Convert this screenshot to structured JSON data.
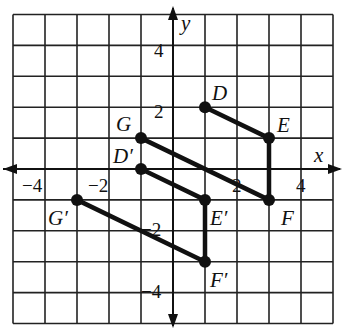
{
  "diagram": {
    "type": "coordinate-plane-translation",
    "grid": {
      "xmin": -5,
      "xmax": 5,
      "ymin": -5,
      "ymax": 5,
      "step": 1
    },
    "axes": {
      "x_label": "x",
      "y_label": "y"
    },
    "ticks": {
      "x": [
        {
          "value": -4,
          "text": "−4"
        },
        {
          "value": -2,
          "text": "−2"
        },
        {
          "value": 2,
          "text": "2"
        },
        {
          "value": 4,
          "text": "4"
        }
      ],
      "y": [
        {
          "value": 4,
          "text": "4"
        },
        {
          "value": 2,
          "text": "2"
        },
        {
          "value": -2,
          "text": "−2"
        },
        {
          "value": -4,
          "text": "−4"
        }
      ]
    },
    "original": {
      "name": "DEFG",
      "vertices": [
        {
          "label": "D",
          "x": 1,
          "y": 2
        },
        {
          "label": "E",
          "x": 3,
          "y": 1
        },
        {
          "label": "F",
          "x": 3,
          "y": -1
        },
        {
          "label": "G",
          "x": -1,
          "y": 1
        }
      ]
    },
    "image": {
      "name": "D'E'F'G'",
      "vertices": [
        {
          "label": "D′",
          "x": -1,
          "y": 0
        },
        {
          "label": "E′",
          "x": 1,
          "y": -1
        },
        {
          "label": "F′",
          "x": 1,
          "y": -3
        },
        {
          "label": "G′",
          "x": -3,
          "y": -1
        }
      ]
    },
    "colors": {
      "grid": "#222222",
      "figure": "#111111",
      "background": "#ffffff"
    }
  }
}
